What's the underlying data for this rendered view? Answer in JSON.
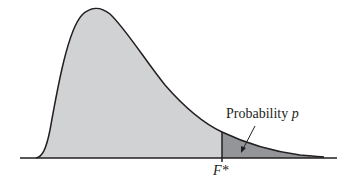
{
  "diagram": {
    "type": "F-distribution density curve with shaded upper tail",
    "annotation": {
      "label_text": "Probability ",
      "label_var": "p"
    },
    "critical_value": {
      "label": "F*"
    },
    "colors": {
      "body_fill": "#d1d2d4",
      "tail_fill": "#939598",
      "stroke": "#231f20",
      "background": "#ffffff"
    }
  }
}
